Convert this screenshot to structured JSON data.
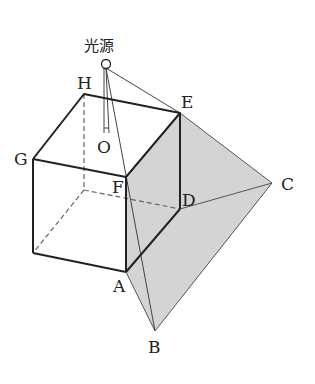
{
  "diagram": {
    "light_source_label": "光源",
    "vertices": {
      "H": {
        "label": "H",
        "x": 84,
        "y": 94
      },
      "E": {
        "label": "E",
        "x": 180,
        "y": 113
      },
      "G": {
        "label": "G",
        "x": 33,
        "y": 159
      },
      "F": {
        "label": "F",
        "x": 126,
        "y": 177
      },
      "D": {
        "label": "D",
        "x": 180,
        "y": 209
      },
      "A": {
        "label": "A",
        "x": 126,
        "y": 272
      },
      "C": {
        "label": "C",
        "x": 272,
        "y": 183
      },
      "B": {
        "label": "B",
        "x": 155,
        "y": 331
      },
      "O": {
        "label": "O",
        "x": 109,
        "y": 133
      }
    },
    "colors": {
      "line": "#222222",
      "thin_line": "#555555",
      "shadow_fill": "#d4d4d4",
      "hidden_line": "#666666"
    }
  }
}
